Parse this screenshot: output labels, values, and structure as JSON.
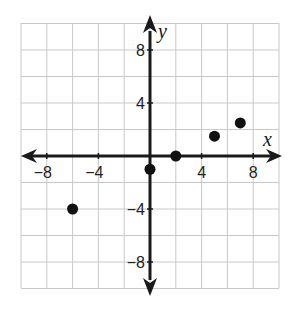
{
  "chart_data": {
    "type": "scatter",
    "title": "",
    "xlabel": "x",
    "ylabel": "y",
    "xlim": [
      -10,
      10
    ],
    "ylim": [
      -10,
      10
    ],
    "grid": true,
    "grid_step": 2,
    "xticks": [
      -8,
      -4,
      4,
      8
    ],
    "yticks": [
      8,
      4,
      -4,
      -8
    ],
    "xtick_labels": [
      "−8",
      "−4",
      "4",
      "8"
    ],
    "ytick_labels": [
      "8",
      "4",
      "−4",
      "−8"
    ],
    "series": [
      {
        "name": "points",
        "x": [
          -6,
          0,
          2,
          5,
          7
        ],
        "y": [
          -4,
          -1,
          0,
          1.5,
          2.5
        ]
      }
    ],
    "legend": null
  },
  "colors": {
    "grid": "#c8c8c8",
    "axis": "#1a1a1a",
    "point": "#111111",
    "background": "#ffffff"
  }
}
